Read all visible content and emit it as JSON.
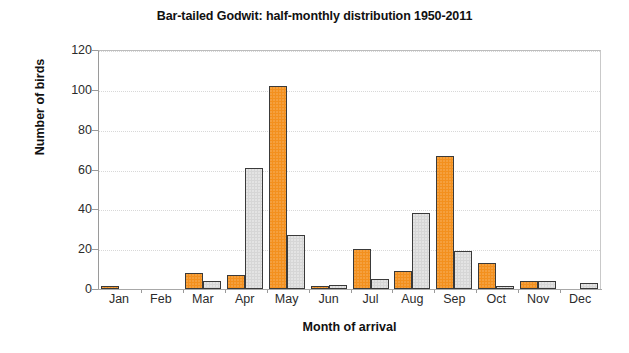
{
  "chart_data": {
    "type": "bar",
    "title": "Bar-tailed Godwit: half-monthly distribution 1950-2011",
    "xlabel": "Month of arrival",
    "ylabel": "Number of birds",
    "categories": [
      "Jan",
      "Feb",
      "Mar",
      "Apr",
      "May",
      "Jun",
      "Jul",
      "Aug",
      "Sep",
      "Oct",
      "Nov",
      "Dec"
    ],
    "series": [
      {
        "name": "first half of month",
        "color": "#f3901e",
        "values": [
          1,
          0,
          8,
          7,
          102,
          1,
          20,
          9,
          67,
          13,
          4,
          0
        ]
      },
      {
        "name": "second half of month",
        "color": "#d6d6d6",
        "values": [
          0,
          0,
          4,
          61,
          27,
          2,
          5,
          38,
          19,
          1,
          4,
          3
        ]
      }
    ],
    "ylim": [
      0,
      120
    ],
    "yticks": [
      0,
      20,
      40,
      60,
      80,
      100,
      120
    ],
    "ytick_labels": [
      "0",
      "20",
      "40",
      "60",
      "80",
      "100",
      "120"
    ],
    "grid": true,
    "grid_axis": "y",
    "legend": "none"
  }
}
